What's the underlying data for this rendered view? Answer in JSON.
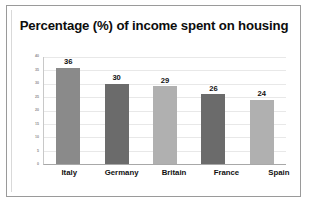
{
  "chart_data": {
    "type": "bar",
    "title": "Percentage (%) of income spent on housing",
    "categories": [
      "Italy",
      "Germany",
      "Britain",
      "France",
      "Spain"
    ],
    "values": [
      36,
      30,
      29,
      26,
      24
    ],
    "data_labels": [
      "36",
      "30",
      "29",
      "26",
      "24"
    ],
    "bar_colors": [
      "#8a8a8a",
      "#6b6b6b",
      "#b0b0b0",
      "#6b6b6b",
      "#b0b0b0"
    ],
    "xlabel": "",
    "ylabel": "",
    "ylim": [
      0,
      40
    ],
    "ytick_step": 5,
    "yticks": [
      40,
      35,
      30,
      25,
      20,
      15,
      10,
      5,
      0
    ],
    "ytick_labels": [
      "40",
      "35",
      "30",
      "25",
      "20",
      "15",
      "10",
      "5",
      "0"
    ],
    "grid": true,
    "grid_axis": "y",
    "legend": false,
    "legend_position": "none",
    "frame_border_color": "#9a9a9a",
    "background_color": "#ffffff",
    "title_color": "#0d0d0d"
  }
}
